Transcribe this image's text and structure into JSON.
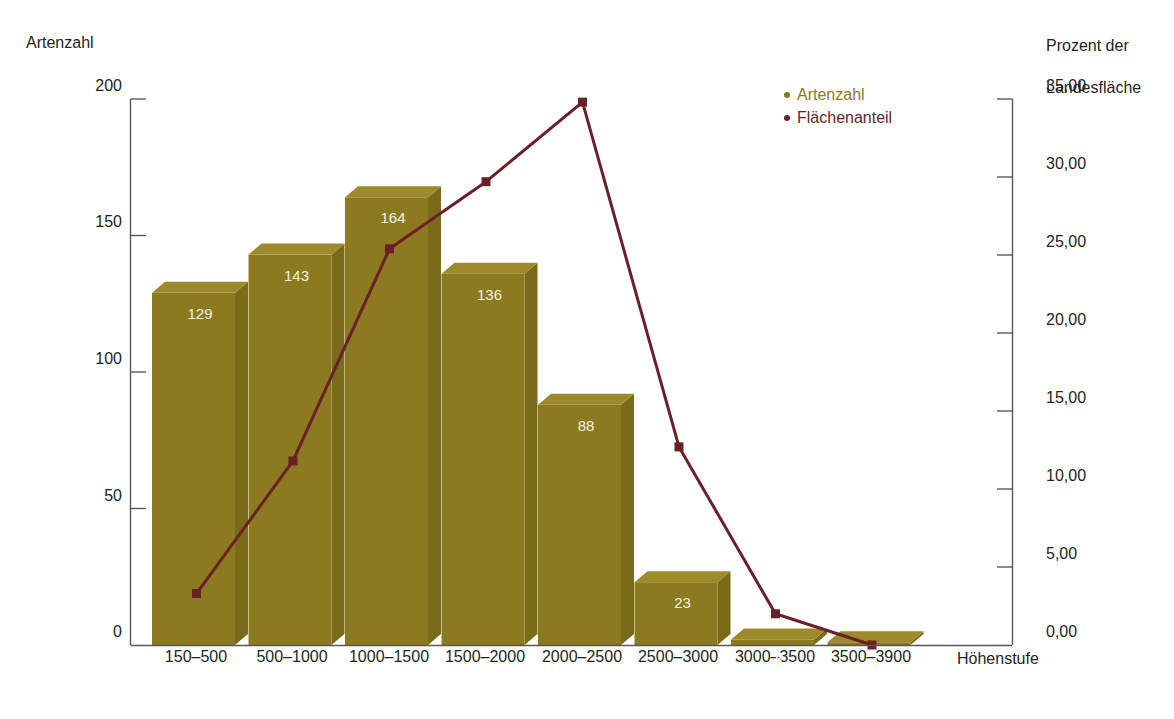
{
  "axes": {
    "left_title": "Artenzahl",
    "right_title_line1": "Prozent der",
    "right_title_line2": "Landesfläche",
    "x_title": "Höhenstufe",
    "left_ticks": [
      "200",
      "150",
      "100",
      "50",
      "0"
    ],
    "right_ticks": [
      "35,00",
      "30,00",
      "25,00",
      "20,00",
      "15,00",
      "10,00",
      "5,00",
      "0,00"
    ]
  },
  "legend": {
    "items": [
      {
        "label": "Artenzahl",
        "color": "#8b7a20"
      },
      {
        "label": "Flächenanteil",
        "color": "#6b1f28"
      }
    ]
  },
  "colors": {
    "bar_face": "#8b7a20",
    "bar_top": "#9c8a2b",
    "bar_side": "#7a6b1b",
    "line": "#6b1f28",
    "marker": "#6b1f28",
    "axis": "#58585a",
    "value_text": "#f4f1e4",
    "background": "#ffffff"
  },
  "chart_data": {
    "type": "bar",
    "title": "",
    "xlabel": "Höhenstufe",
    "ylabel": "Artenzahl",
    "y2label": "Prozent der Landesfläche",
    "categories": [
      "150–500",
      "500–1000",
      "1000–1500",
      "1500–2000",
      "2000–2500",
      "2500–3000",
      "3000–3500",
      "3500–3900"
    ],
    "ylim": [
      0,
      200
    ],
    "y2lim": [
      0,
      35
    ],
    "grid": false,
    "legend_position": "top-right",
    "series": [
      {
        "name": "Artenzahl",
        "type": "bar",
        "axis": "left",
        "color": "#8b7a20",
        "values": [
          129,
          143,
          164,
          136,
          88,
          23,
          2,
          1
        ],
        "labels": [
          "129",
          "143",
          "164",
          "136",
          "88",
          "23",
          "2",
          "1"
        ]
      },
      {
        "name": "Flächenanteil",
        "type": "line",
        "axis": "right",
        "color": "#6b1f28",
        "values": [
          3.3,
          11.8,
          25.4,
          29.7,
          34.8,
          12.7,
          2.0,
          0.0
        ]
      }
    ]
  }
}
